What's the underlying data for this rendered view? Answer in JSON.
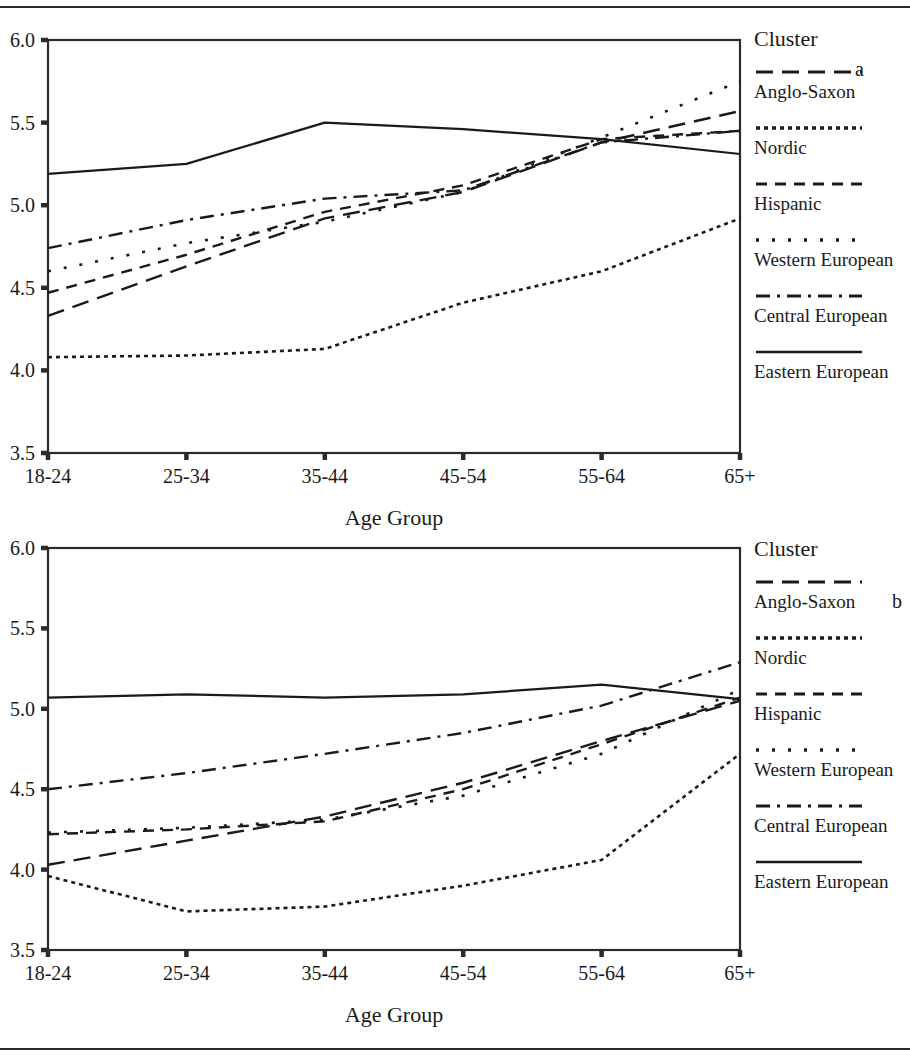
{
  "figure": {
    "panels": [
      {
        "letter": "a",
        "legend_title": "Cluster",
        "xlabel": "Age Group"
      },
      {
        "letter": "b",
        "legend_title": "Cluster",
        "xlabel": "Age Group"
      }
    ],
    "colors": {
      "ink": "#1a1a1a",
      "frame": "#2b2b2b",
      "background": "#ffffff"
    }
  },
  "chart_data": [
    {
      "type": "line",
      "panel": "a",
      "title": "",
      "xlabel": "Age Group",
      "ylabel": "",
      "categories": [
        "18-24",
        "25-34",
        "35-44",
        "45-54",
        "55-64",
        "65+"
      ],
      "ylim": [
        3.5,
        6.0
      ],
      "yticks": [
        3.5,
        4.0,
        4.5,
        5.0,
        5.5,
        6.0
      ],
      "ytick_labels": [
        "3.5",
        "4.0",
        "4.5",
        "5.0",
        "5.5",
        "6.0"
      ],
      "grid": false,
      "legend_position": "right",
      "legend_title": "Cluster",
      "series": [
        {
          "name": "Anglo-Saxon",
          "dash": "long-dash",
          "values": [
            4.33,
            4.63,
            4.92,
            5.08,
            5.38,
            5.57
          ]
        },
        {
          "name": "Nordic",
          "dash": "fine-dot",
          "values": [
            4.08,
            4.09,
            4.13,
            4.41,
            4.6,
            4.92
          ]
        },
        {
          "name": "Hispanic",
          "dash": "dash",
          "values": [
            4.47,
            4.7,
            4.96,
            5.12,
            5.4,
            5.45
          ]
        },
        {
          "name": "Western European",
          "dash": "sparse-dot",
          "values": [
            4.6,
            4.77,
            4.9,
            5.08,
            5.41,
            5.75
          ]
        },
        {
          "name": "Central European",
          "dash": "dash-dot",
          "values": [
            4.74,
            4.91,
            5.04,
            5.09,
            5.38,
            5.45
          ]
        },
        {
          "name": "Eastern European",
          "dash": "solid",
          "values": [
            5.19,
            5.25,
            5.5,
            5.46,
            5.4,
            5.31
          ]
        }
      ]
    },
    {
      "type": "line",
      "panel": "b",
      "title": "",
      "xlabel": "Age Group",
      "ylabel": "",
      "categories": [
        "18-24",
        "25-34",
        "35-44",
        "45-54",
        "55-64",
        "65+"
      ],
      "ylim": [
        3.5,
        6.0
      ],
      "yticks": [
        3.5,
        4.0,
        4.5,
        5.0,
        5.5,
        6.0
      ],
      "ytick_labels": [
        "3.5",
        "4.0",
        "4.5",
        "5.0",
        "5.5",
        "6.0"
      ],
      "grid": false,
      "legend_position": "right",
      "legend_title": "Cluster",
      "series": [
        {
          "name": "Anglo-Saxon",
          "dash": "long-dash",
          "values": [
            4.03,
            4.18,
            4.33,
            4.54,
            4.8,
            5.05
          ]
        },
        {
          "name": "Nordic",
          "dash": "fine-dot",
          "values": [
            3.96,
            3.74,
            3.77,
            3.9,
            4.06,
            4.72
          ]
        },
        {
          "name": "Hispanic",
          "dash": "dash",
          "values": [
            4.22,
            4.25,
            4.3,
            4.5,
            4.78,
            5.07
          ]
        },
        {
          "name": "Western European",
          "dash": "sparse-dot",
          "values": [
            4.23,
            4.26,
            4.31,
            4.46,
            4.72,
            5.12
          ]
        },
        {
          "name": "Central European",
          "dash": "dash-dot",
          "values": [
            4.5,
            4.6,
            4.72,
            4.85,
            5.02,
            5.29
          ]
        },
        {
          "name": "Eastern European",
          "dash": "solid",
          "values": [
            5.07,
            5.09,
            5.07,
            5.09,
            5.15,
            5.06
          ]
        }
      ]
    }
  ]
}
